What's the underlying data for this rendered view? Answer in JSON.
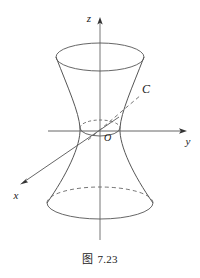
{
  "figure": {
    "caption_prefix": "图",
    "caption_number": "7.23",
    "caption_full": "图 7.23",
    "colors": {
      "ink": "#4a4a4a",
      "ink_dark": "#1a1a1a",
      "background": "#ffffff"
    },
    "labels": {
      "z_axis": "z",
      "y_axis": "y",
      "x_axis": "x",
      "origin": "O",
      "curve": "C"
    },
    "geometry": {
      "surface": "hyperboloid-of-one-sheet",
      "origin_px": [
        100,
        131
      ],
      "top_ellipse": {
        "cx": 100,
        "cy": 57,
        "rx": 44,
        "ry": 14,
        "hidden_half": "none"
      },
      "waist_ellipse": {
        "cx": 100,
        "cy": 128,
        "rx": 20,
        "ry": 8,
        "hidden_half": "upper"
      },
      "bottom_ellipse": {
        "cx": 100,
        "cy": 203,
        "rx": 53,
        "ry": 16,
        "hidden_half": "upper"
      },
      "z_axis_px": {
        "x1": 100,
        "y1": 240,
        "x2": 100,
        "y2": 18
      },
      "y_axis_px": {
        "x1": 48,
        "y1": 131,
        "x2": 186,
        "y2": 131
      },
      "x_axis_px": {
        "x1": 118,
        "y1": 118,
        "x2": 21,
        "y2": 184
      },
      "curve_C_px": {
        "x1": 90,
        "y1": 139,
        "x2": 140,
        "y2": 96
      }
    }
  }
}
